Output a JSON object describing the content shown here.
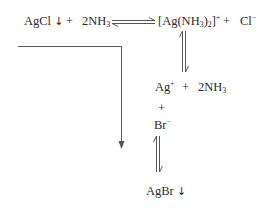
{
  "diagram": {
    "type": "chemical-equilibrium-scheme",
    "row1": {
      "reactant1": "AgCl",
      "reactant1_precip": "↓",
      "plus1": "+",
      "reactant2_coeff": "2NH",
      "reactant2_sub": "3",
      "arrow": "equilibrium-horizontal",
      "product1_a": "[Ag(NH",
      "product1_sub1": "3",
      "product1_b": ")",
      "product1_sub2": "2",
      "product1_c": "]",
      "product1_charge": "+",
      "plus2": "+",
      "product2": "Cl",
      "product2_charge": "−"
    },
    "row2": {
      "ion1": "Ag",
      "ion1_charge": "+",
      "plus": "+",
      "species2": "2NH",
      "species2_sub": "3"
    },
    "row3": {
      "plus": "+"
    },
    "row4": {
      "ion": "Br",
      "ion_charge": "−"
    },
    "row5": {
      "product": "AgBr",
      "product_precip": "↓"
    },
    "arrows": [
      {
        "name": "equilibrium-horizontal",
        "from": "AgCl + 2NH3",
        "to": "[Ag(NH3)2]+ + Cl−"
      },
      {
        "name": "equilibrium-vertical-upper",
        "from": "[Ag(NH3)2]+",
        "to": "Ag+ + 2NH3"
      },
      {
        "name": "equilibrium-vertical-lower",
        "from": "Br−",
        "to": "AgBr"
      },
      {
        "name": "l-shaped-arrow",
        "description": "from left bracket down toward AgBr formation"
      }
    ],
    "colors": {
      "text": "#2a2a2a",
      "line": "#555555",
      "background": "#ffffff"
    }
  }
}
